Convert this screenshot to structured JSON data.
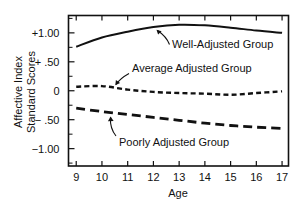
{
  "chart_data": {
    "type": "line",
    "title": "",
    "xlabel": "Age",
    "ylabel": "Affective Index Standard Scores",
    "ylabel_line1": "Affective Index",
    "ylabel_line2": "Standard Scores",
    "x": [
      9,
      10,
      11,
      12,
      13,
      14,
      15,
      16,
      17
    ],
    "xlim": [
      8.7,
      17.25
    ],
    "ylim": [
      -1.3,
      1.3
    ],
    "xtick_labels": [
      "9",
      "10",
      "11",
      "12",
      "13",
      "14",
      "15",
      "16",
      "17"
    ],
    "ytick_values": [
      1.0,
      0.5,
      0,
      -0.5,
      -1.0
    ],
    "ytick_labels": [
      "+1.00",
      "+ .50",
      "0",
      "− .50",
      "−1.00"
    ],
    "yminor_values": [
      1.25,
      0.75,
      0.25,
      -0.25,
      -0.75,
      -1.25
    ],
    "grid": false,
    "legend_position": "inline-annotations",
    "series": [
      {
        "name": "Well-Adjusted Group",
        "style": "solid",
        "values": [
          0.76,
          0.92,
          1.02,
          1.1,
          1.14,
          1.13,
          1.09,
          1.04,
          1.0
        ]
      },
      {
        "name": "Average Adjusted Group",
        "style": "short-dashed",
        "values": [
          0.07,
          0.08,
          0.02,
          -0.02,
          -0.04,
          -0.05,
          -0.07,
          -0.04,
          -0.01
        ]
      },
      {
        "name": "Poorly Adjusted Group",
        "style": "long-dashed",
        "values": [
          -0.3,
          -0.36,
          -0.41,
          -0.46,
          -0.51,
          -0.56,
          -0.6,
          -0.63,
          -0.65
        ]
      }
    ],
    "annotations": [
      {
        "text": "Well-Adjusted Group",
        "points_to_series": "Well-Adjusted Group",
        "points_to_x": 12.0
      },
      {
        "text": "Average Adjusted Group",
        "points_to_series": "Average Adjusted Group",
        "points_to_x": 10.0
      },
      {
        "text": "Poorly Adjusted Group",
        "points_to_series": "Poorly Adjusted Group",
        "points_to_x": 10.6
      }
    ],
    "colors": {
      "line": "#111111",
      "background": "#ffffff",
      "axis": "#111111"
    }
  }
}
